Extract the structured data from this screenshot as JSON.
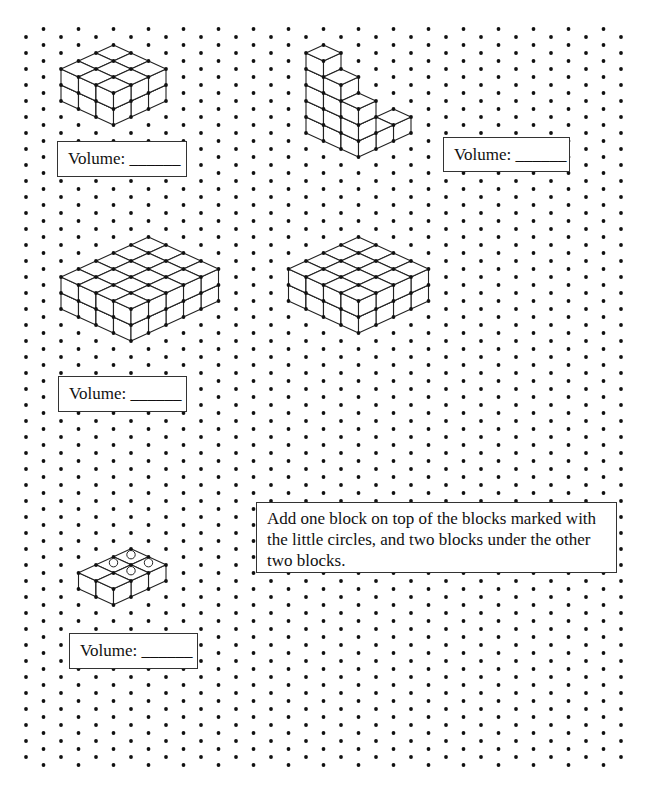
{
  "worksheet": {
    "grid": {
      "type": "isometric-dots",
      "columns": 35,
      "x_start": 26,
      "x_step": 17.5,
      "y_step": 16,
      "even_col_y_start": 37,
      "odd_col_y_start": 29,
      "rows": 46,
      "y_max": 766,
      "dot_radius": 1.9,
      "dot_color": "#111111"
    },
    "line_color": "#222222",
    "shapes": [
      {
        "id": "shape-1",
        "origin": [
          61,
          101
        ],
        "cubes": [
          {
            "a": 0,
            "b": 0,
            "h": 2
          },
          {
            "a": 0,
            "b": 1,
            "h": 2
          },
          {
            "a": 0,
            "b": 2,
            "h": 2
          },
          {
            "a": 1,
            "b": 0,
            "h": 2
          },
          {
            "a": 1,
            "b": 1,
            "h": 2
          },
          {
            "a": 1,
            "b": 2,
            "h": 2
          },
          {
            "a": 2,
            "b": 0,
            "h": 2
          },
          {
            "a": 2,
            "b": 1,
            "h": 2
          },
          {
            "a": 2,
            "b": 2,
            "h": 2
          }
        ]
      },
      {
        "id": "shape-2-staircase",
        "origin": [
          306,
          133
        ],
        "cubes": [
          {
            "a": 0,
            "b": 0,
            "h": 5
          },
          {
            "a": 1,
            "b": 0,
            "h": 4
          },
          {
            "a": 2,
            "b": 0,
            "h": 3
          },
          {
            "a": 2,
            "b": 1,
            "h": 1
          },
          {
            "a": 2,
            "b": 2,
            "h": 1
          }
        ]
      },
      {
        "id": "shape-3",
        "origin": [
          61,
          309
        ],
        "dims": {
          "a": 4,
          "b": 5,
          "h": 2
        }
      },
      {
        "id": "shape-4",
        "origin": [
          288.5,
          301
        ],
        "dims": {
          "a": 4,
          "b": 4,
          "h": 2
        }
      },
      {
        "id": "shape-5-marked",
        "origin": [
          78.5,
          588.7
        ],
        "dims": {
          "a": 2,
          "b": 3,
          "h": 1
        },
        "circles": [
          {
            "a": 0,
            "b": 1
          },
          {
            "a": 0,
            "b": 2
          },
          {
            "a": 1,
            "b": 1
          },
          {
            "a": 1,
            "b": 2
          }
        ]
      }
    ],
    "volume_boxes": [
      {
        "id": "volume-box-1",
        "label": "Volume: ______",
        "x": 57,
        "y": 141,
        "w": 130,
        "h": 36
      },
      {
        "id": "volume-box-2",
        "label": "Volume: ______",
        "x": 443,
        "y": 137,
        "w": 127,
        "h": 35
      },
      {
        "id": "volume-box-3",
        "label": "Volume: ______",
        "x": 58,
        "y": 376,
        "w": 129,
        "h": 36
      },
      {
        "id": "volume-box-4",
        "label": "Volume: ______",
        "x": 69,
        "y": 633,
        "w": 129,
        "h": 36
      }
    ],
    "instruction": {
      "text": "Add one block on top of the blocks marked with the little circles, and two blocks under the other two blocks.",
      "x": 256,
      "y": 502,
      "w": 361,
      "h": 71
    }
  }
}
